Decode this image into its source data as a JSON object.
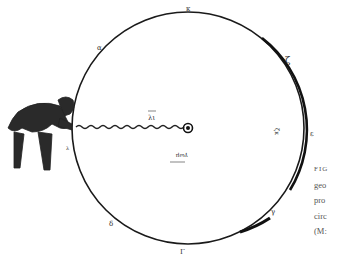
{
  "figure": {
    "circle_labels": {
      "top": "κ",
      "upper_right": "ζ",
      "right": "ε",
      "lower_right": "γ",
      "bottom": "Γ",
      "lower_left": "δ",
      "upper_left": "α",
      "left": "λ",
      "inner_upper": "λι",
      "inner_right": "ζκ",
      "inner_lower": "γωμ"
    },
    "colors": {
      "ink": "#1a1a1a",
      "paper": "#ffffff",
      "caption": "#555555"
    }
  },
  "caption": {
    "lines": [
      "FIG",
      "geo",
      "pro",
      "circ",
      "(M:"
    ]
  }
}
